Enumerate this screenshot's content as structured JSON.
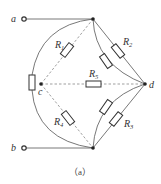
{
  "diagram": {
    "type": "circuit",
    "nodes": {
      "a": {
        "label": "a"
      },
      "b": {
        "label": "b"
      },
      "c": {
        "label": "c"
      },
      "d": {
        "label": "d"
      }
    },
    "resistors": [
      {
        "id": "R1",
        "label": "R",
        "sub": "1"
      },
      {
        "id": "R2",
        "label": "R",
        "sub": "2"
      },
      {
        "id": "R3",
        "label": "R",
        "sub": "3"
      },
      {
        "id": "R4",
        "label": "R",
        "sub": "4"
      },
      {
        "id": "R5",
        "label": "R",
        "sub": "5"
      }
    ],
    "caption": "（a）"
  }
}
